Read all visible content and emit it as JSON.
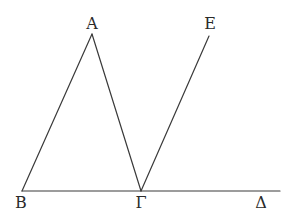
{
  "diagram": {
    "type": "geometry",
    "stroke_color": "#3a3a3a",
    "label_color": "#2a2a2a",
    "points": {
      "A": {
        "label": "Α",
        "x": 92,
        "y": 34,
        "label_x": 92,
        "label_y": 29
      },
      "B": {
        "label": "Β",
        "x": 22,
        "y": 191,
        "label_x": 21,
        "label_y": 208
      },
      "G": {
        "label": "Γ",
        "x": 141,
        "y": 191,
        "label_x": 141,
        "label_y": 208
      },
      "D": {
        "label": "Δ",
        "x": 280,
        "y": 191,
        "label_x": 261,
        "label_y": 208
      },
      "E": {
        "label": "Ε",
        "x": 209,
        "y": 36,
        "label_x": 210,
        "label_y": 29
      }
    },
    "segments": [
      {
        "name": "segment-BA",
        "from": "B",
        "to": "A"
      },
      {
        "name": "segment-AG",
        "from": "A",
        "to": "G"
      },
      {
        "name": "segment-BD",
        "from": "B",
        "to": "D"
      },
      {
        "name": "segment-GE",
        "from": "G",
        "to": "E"
      }
    ]
  }
}
